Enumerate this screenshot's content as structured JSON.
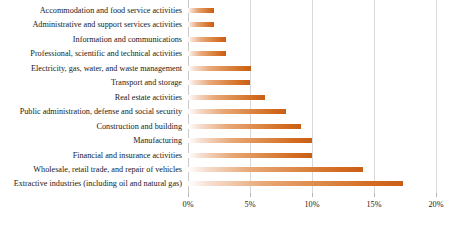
{
  "chart_data": {
    "type": "bar",
    "orientation": "horizontal",
    "title": "",
    "subtitle": "",
    "xlabel": "",
    "ylabel": "",
    "xlim": [
      0,
      20
    ],
    "xtick_labels": [
      "0%",
      "5%",
      "10%",
      "15%",
      "20%"
    ],
    "xtick_values": [
      0,
      5,
      10,
      15,
      20
    ],
    "grid": true,
    "legend": false,
    "value_suffix": "%",
    "categories": [
      "Accommodation and food service activities",
      "Administrative and support services activities",
      "Information and communications",
      "Professional, scientific and technical activities",
      "Electricity, gas, water, and waste management",
      "Transport and storage",
      "Real estate activities",
      "Public administration, defense and social security",
      "Construction and building",
      "Manufacturing",
      "Financial and insurance activities",
      "Wholesale, retail trade, and repair of vehicles",
      "Extractive industries (including oil and natural gas)"
    ],
    "values": [
      2.1,
      2.1,
      3.1,
      3.1,
      5.1,
      5.0,
      6.2,
      7.9,
      9.1,
      10.0,
      10.0,
      14.1,
      17.3
    ],
    "series": [
      {
        "name": "Share",
        "values": [
          2.1,
          2.1,
          3.1,
          3.1,
          5.1,
          5.0,
          6.2,
          7.9,
          9.1,
          10.0,
          10.0,
          14.1,
          17.3
        ]
      }
    ],
    "colors": {
      "bar_start": "#ffffff",
      "bar_end": "#d2691e",
      "gridline": "#d9d9d9",
      "text": "#1a1a1a"
    }
  }
}
